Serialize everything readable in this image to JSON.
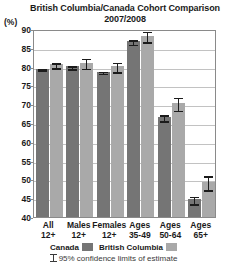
{
  "chart_data": {
    "type": "bar",
    "title": "British Columbia/Canada Cohort Comparison",
    "subtitle": "2007/2008",
    "ylabel": "(%)",
    "xlabel": "",
    "ylim": [
      40,
      90
    ],
    "ytick_step": 5,
    "yticks": [
      90,
      85,
      80,
      75,
      70,
      65,
      60,
      55,
      50,
      45,
      40
    ],
    "grid": true,
    "legend_position": "bottom",
    "error_bars": "95% confidence limits of estimate",
    "categories": [
      "All\n12+",
      "Males\n12+",
      "Females\n12+",
      "Ages\n35-49",
      "Ages\n50-64",
      "Ages\n65+"
    ],
    "category_lines": [
      [
        "All",
        "12+"
      ],
      [
        "Males",
        "12+"
      ],
      [
        "Females",
        "12+"
      ],
      [
        "Ages",
        "35-49"
      ],
      [
        "Ages",
        "50-64"
      ],
      [
        "Ages",
        "65+"
      ]
    ],
    "series": [
      {
        "name": "Canada",
        "color": "#757575",
        "values": [
          79.4,
          80.1,
          78.7,
          86.8,
          66.6,
          44.7
        ],
        "ci_low": [
          79.0,
          79.5,
          78.2,
          86.0,
          65.6,
          43.5
        ],
        "ci_high": [
          79.8,
          80.7,
          79.2,
          87.6,
          67.6,
          45.9
        ]
      },
      {
        "name": "British Columbia",
        "color": "#a9a9a9",
        "values": [
          80.6,
          81.1,
          80.1,
          88.2,
          70.3,
          49.3
        ],
        "ci_low": [
          79.7,
          79.6,
          78.6,
          86.6,
          68.4,
          47.2
        ],
        "ci_high": [
          81.5,
          82.6,
          81.6,
          89.8,
          72.2,
          51.4
        ]
      }
    ]
  },
  "legend": {
    "entries": [
      {
        "label": "Canada",
        "swatch": "canada"
      },
      {
        "label": "British Columbia",
        "swatch": "bc"
      }
    ],
    "ci_note": "95% confidence limits of estimate"
  }
}
